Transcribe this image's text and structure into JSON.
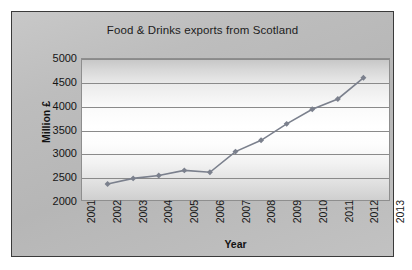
{
  "chart_data": {
    "type": "line",
    "title": "Food & Drinks exports from Scotland",
    "xlabel": "Year",
    "ylabel": "Million £",
    "x": [
      2002,
      2003,
      2004,
      2005,
      2006,
      2007,
      2008,
      2009,
      2010,
      2011,
      2012
    ],
    "values": [
      2340,
      2460,
      2520,
      2630,
      2590,
      3030,
      3270,
      3620,
      3930,
      4150,
      4600
    ],
    "series": [
      {
        "name": "Food & Drinks exports",
        "values": [
          2340,
          2460,
          2520,
          2630,
          2590,
          3030,
          3270,
          3620,
          3930,
          4150,
          4600
        ]
      }
    ],
    "xlim": [
      2001,
      2013
    ],
    "ylim": [
      2000,
      5000
    ],
    "ytick_labels": [
      "5000",
      "4500",
      "4000",
      "3500",
      "3000",
      "2500",
      "2000"
    ],
    "ytick_values": [
      5000,
      4500,
      4000,
      3500,
      3000,
      2500,
      2000
    ],
    "xtick_labels": [
      "2001",
      "2002",
      "2003",
      "2004",
      "2005",
      "2006",
      "2007",
      "2008",
      "2009",
      "2010",
      "2011",
      "2012",
      "2013"
    ],
    "xtick_values": [
      2001,
      2002,
      2003,
      2004,
      2005,
      2006,
      2007,
      2008,
      2009,
      2010,
      2011,
      2012,
      2013
    ],
    "grid": true,
    "legend": false,
    "legend_position": "none",
    "marker": "diamond",
    "series_color": "#7b808d",
    "gridline_color": "#8a8a8a",
    "plot_background": "#ffffff",
    "chart_background": "#bdbdbd",
    "border_color": "#3a3a3a",
    "text_color": "#151515"
  }
}
